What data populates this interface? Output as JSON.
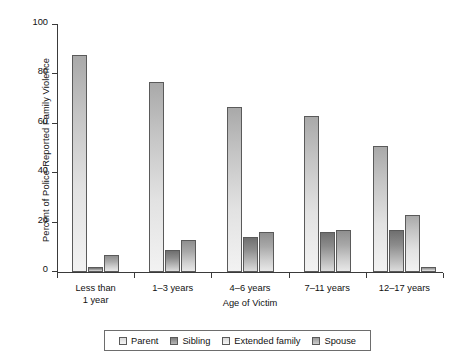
{
  "chart_data": {
    "type": "bar",
    "title": "",
    "xlabel": "Age of Victim",
    "ylabel": "Percent of Police-Reported Family Violence",
    "ylim": [
      0,
      100
    ],
    "yticks": [
      0,
      20,
      40,
      60,
      80,
      100
    ],
    "ytick_labels": [
      "0",
      "20",
      "40",
      "60",
      "80",
      "100"
    ],
    "grid": false,
    "legend_position": "bottom",
    "categories": [
      "Less than 1 year",
      "1–3 years",
      "4–6 years",
      "7–11 years",
      "12–17 years"
    ],
    "category_label_lines": [
      [
        "Less than",
        "1 year"
      ],
      [
        "1–3 years"
      ],
      [
        "4–6 years"
      ],
      [
        "7–11 years"
      ],
      [
        "12–17 years"
      ]
    ],
    "series": [
      {
        "name": "Parent",
        "values": [
          88,
          77,
          67,
          63,
          51
        ]
      },
      {
        "name": "Sibling",
        "values": [
          2,
          9,
          14,
          16,
          17
        ]
      },
      {
        "name": "Extended family",
        "values": [
          null,
          null,
          null,
          null,
          23
        ]
      },
      {
        "name": "Spouse",
        "values": [
          7,
          13,
          16,
          17,
          2
        ]
      }
    ],
    "colors": {
      "parent": "#e2e2e2",
      "sibling": "#8c8c8c",
      "extended_family": "#e2e2e2",
      "spouse": "#b6b6b6",
      "axis": "#3a3a3a",
      "text": "#111111",
      "background": "#ffffff"
    }
  },
  "legend": {
    "items": [
      {
        "label": "Parent",
        "key": "parent"
      },
      {
        "label": "Sibling",
        "key": "sibling"
      },
      {
        "label": "Extended family",
        "key": "extended"
      },
      {
        "label": "Spouse",
        "key": "spouse"
      }
    ]
  }
}
